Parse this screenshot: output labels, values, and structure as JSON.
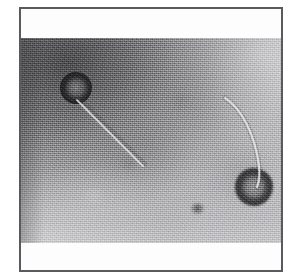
{
  "figure": {
    "domain": "Natural-Image",
    "kind": "transmission-electron-micrograph",
    "caption": "",
    "frame": {
      "border_color": "#5a5a5e",
      "border_width_px": 2,
      "plate_background": "#fdfdfd"
    },
    "micrograph": {
      "background_dark": "#8d8d90",
      "background_light": "#c2c2c5",
      "grain": "negative-stain speckle",
      "illumination": "darker upper-left, brighter upper-right and lower-left"
    },
    "particles": [
      {
        "id": "phage-upper-left",
        "label": "bacteriophage particle 1",
        "head_shape": "icosahedral capsid",
        "head_center_px": [
          55,
          50
        ],
        "head_diameter_px": 32,
        "tail": "straight tail fibre directed lower-right",
        "tail_length_px": 72,
        "capsid_color": "#26262a",
        "core_color": "#919193"
      },
      {
        "id": "phage-lower-right",
        "label": "bacteriophage particle 2",
        "head_shape": "icosahedral capsid",
        "head_center_px": [
          233,
          149
        ],
        "head_diameter_px": 38,
        "tail": "long curved tail fibre arcing up and to the left",
        "tail_length_px": 96,
        "capsid_color": "#2c2c30",
        "core_color": "#969698"
      }
    ],
    "debris": [
      {
        "id": "stain-speck",
        "center_px": [
          176,
          170
        ],
        "tone": "dark"
      },
      {
        "id": "stain-cloud-a",
        "center_px": [
          107,
          125
        ],
        "tone": "dark"
      },
      {
        "id": "stain-cloud-b",
        "center_px": [
          159,
          63
        ],
        "tone": "dark"
      },
      {
        "id": "stain-cloud-c",
        "center_px": [
          73,
          158
        ],
        "tone": "light"
      }
    ]
  }
}
